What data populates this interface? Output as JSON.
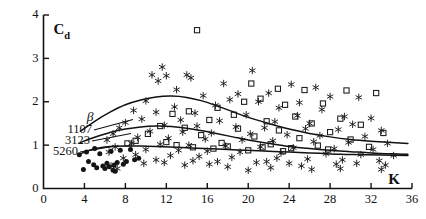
{
  "chart_data": {
    "type": "scatter",
    "title": "",
    "xlabel": "K",
    "ylabel": "Cd",
    "ylabel_main": "C",
    "ylabel_sub": "d",
    "xlim": [
      0,
      36
    ],
    "ylim": [
      0,
      4
    ],
    "xticks": [
      0,
      4,
      8,
      12,
      16,
      20,
      24,
      28,
      32,
      36
    ],
    "yticks": [
      0,
      1,
      2,
      3,
      4
    ],
    "grid": false,
    "legend_position": "inside-left",
    "legend_header": "β",
    "legend_entries": [
      {
        "label": "1107",
        "curve": "beta_1107"
      },
      {
        "label": "3123",
        "curve": "beta_3123"
      },
      {
        "label": "5260",
        "curve": "beta_5260"
      }
    ],
    "series": [
      {
        "name": "beta_1107",
        "kind": "curve",
        "points": [
          [
            3.6,
            1.32
          ],
          [
            5.0,
            1.55
          ],
          [
            6.5,
            1.76
          ],
          [
            8.0,
            1.93
          ],
          [
            9.5,
            2.04
          ],
          [
            11.0,
            2.11
          ],
          [
            12.5,
            2.13
          ],
          [
            14.0,
            2.1
          ],
          [
            15.5,
            2.02
          ],
          [
            17.0,
            1.9
          ],
          [
            18.5,
            1.77
          ],
          [
            20.0,
            1.64
          ],
          [
            22.0,
            1.5
          ],
          [
            24.0,
            1.37
          ],
          [
            26.0,
            1.27
          ],
          [
            28.0,
            1.19
          ],
          [
            30.0,
            1.13
          ],
          [
            32.0,
            1.09
          ],
          [
            34.0,
            1.06
          ],
          [
            35.6,
            1.04
          ]
        ]
      },
      {
        "name": "beta_3123",
        "kind": "curve",
        "points": [
          [
            3.6,
            1.06
          ],
          [
            5.0,
            1.18
          ],
          [
            6.5,
            1.29
          ],
          [
            8.0,
            1.37
          ],
          [
            9.5,
            1.42
          ],
          [
            11.0,
            1.44
          ],
          [
            12.5,
            1.43
          ],
          [
            14.0,
            1.39
          ],
          [
            15.5,
            1.33
          ],
          [
            17.0,
            1.26
          ],
          [
            18.5,
            1.19
          ],
          [
            20.0,
            1.12
          ],
          [
            22.0,
            1.04
          ],
          [
            24.0,
            0.97
          ],
          [
            26.0,
            0.92
          ],
          [
            28.0,
            0.88
          ],
          [
            30.0,
            0.85
          ],
          [
            32.0,
            0.82
          ],
          [
            34.0,
            0.8
          ],
          [
            35.6,
            0.79
          ]
        ]
      },
      {
        "name": "beta_5260",
        "kind": "curve",
        "points": [
          [
            3.6,
            0.8
          ],
          [
            4.5,
            0.88
          ],
          [
            5.5,
            0.94
          ],
          [
            6.5,
            0.97
          ],
          [
            8.0,
            0.98
          ],
          [
            9.5,
            0.98
          ],
          [
            11.0,
            0.97
          ],
          [
            13.0,
            0.95
          ],
          [
            15.0,
            0.93
          ],
          [
            17.0,
            0.91
          ],
          [
            19.0,
            0.89
          ],
          [
            21.0,
            0.87
          ],
          [
            23.0,
            0.85
          ],
          [
            25.0,
            0.83
          ],
          [
            27.0,
            0.81
          ],
          [
            29.0,
            0.79
          ],
          [
            31.0,
            0.78
          ],
          [
            33.0,
            0.77
          ],
          [
            35.6,
            0.76
          ]
        ]
      },
      {
        "name": "squares",
        "kind": "scatter",
        "marker": "open-square",
        "points": [
          [
            15.0,
            3.65
          ],
          [
            20.3,
            2.42
          ],
          [
            22.9,
            2.3
          ],
          [
            25.5,
            2.27
          ],
          [
            29.6,
            2.26
          ],
          [
            32.5,
            2.2
          ],
          [
            21.2,
            2.07
          ],
          [
            19.6,
            2.0
          ],
          [
            27.3,
            1.96
          ],
          [
            23.6,
            1.93
          ],
          [
            17.0,
            1.86
          ],
          [
            14.2,
            1.78
          ],
          [
            12.6,
            1.72
          ],
          [
            18.6,
            1.7
          ],
          [
            24.6,
            1.66
          ],
          [
            29.0,
            1.61
          ],
          [
            16.2,
            1.58
          ],
          [
            21.8,
            1.55
          ],
          [
            26.2,
            1.5
          ],
          [
            31.0,
            1.47
          ],
          [
            11.4,
            1.44
          ],
          [
            13.8,
            1.4
          ],
          [
            19.0,
            1.38
          ],
          [
            23.0,
            1.34
          ],
          [
            28.0,
            1.3
          ],
          [
            33.2,
            1.28
          ],
          [
            10.2,
            1.26
          ],
          [
            15.4,
            1.23
          ],
          [
            20.6,
            1.2
          ],
          [
            25.0,
            1.16
          ],
          [
            30.0,
            1.13
          ],
          [
            9.0,
            1.1
          ],
          [
            12.0,
            1.07
          ],
          [
            17.4,
            1.05
          ],
          [
            22.2,
            1.02
          ],
          [
            26.8,
            0.99
          ],
          [
            31.8,
            0.96
          ],
          [
            8.2,
            1.04
          ],
          [
            13.0,
            1.0
          ],
          [
            18.0,
            0.97
          ],
          [
            21.4,
            0.95
          ],
          [
            24.2,
            0.93
          ],
          [
            27.8,
            0.9
          ],
          [
            20.0,
            0.88
          ],
          [
            23.4,
            0.86
          ],
          [
            16.6,
            0.92
          ],
          [
            14.6,
            0.95
          ]
        ]
      },
      {
        "name": "asterisks",
        "kind": "scatter",
        "marker": "asterisk",
        "points": [
          [
            11.6,
            2.8
          ],
          [
            10.6,
            2.62
          ],
          [
            12.0,
            2.6
          ],
          [
            14.0,
            2.62
          ],
          [
            14.4,
            2.55
          ],
          [
            11.2,
            2.48
          ],
          [
            20.4,
            2.72
          ],
          [
            17.6,
            2.42
          ],
          [
            24.2,
            2.4
          ],
          [
            26.6,
            2.33
          ],
          [
            22.0,
            2.2
          ],
          [
            19.0,
            2.18
          ],
          [
            13.0,
            2.28
          ],
          [
            15.6,
            2.14
          ],
          [
            28.0,
            2.12
          ],
          [
            30.8,
            2.1
          ],
          [
            18.2,
            2.05
          ],
          [
            21.0,
            2.0
          ],
          [
            25.0,
            1.98
          ],
          [
            16.8,
            1.92
          ],
          [
            10.0,
            2.02
          ],
          [
            12.8,
            1.88
          ],
          [
            23.0,
            1.86
          ],
          [
            27.2,
            1.82
          ],
          [
            8.8,
            1.8
          ],
          [
            11.0,
            1.76
          ],
          [
            14.8,
            1.74
          ],
          [
            19.8,
            1.7
          ],
          [
            24.8,
            1.68
          ],
          [
            29.4,
            1.66
          ],
          [
            32.0,
            1.62
          ],
          [
            9.6,
            1.6
          ],
          [
            13.4,
            1.58
          ],
          [
            17.2,
            1.56
          ],
          [
            22.6,
            1.54
          ],
          [
            26.0,
            1.5
          ],
          [
            30.2,
            1.48
          ],
          [
            8.0,
            1.52
          ],
          [
            11.8,
            1.46
          ],
          [
            15.0,
            1.44
          ],
          [
            18.8,
            1.42
          ],
          [
            21.6,
            1.4
          ],
          [
            25.6,
            1.38
          ],
          [
            28.8,
            1.36
          ],
          [
            33.0,
            1.34
          ],
          [
            7.4,
            1.4
          ],
          [
            10.4,
            1.32
          ],
          [
            13.6,
            1.3
          ],
          [
            16.4,
            1.28
          ],
          [
            20.2,
            1.26
          ],
          [
            23.8,
            1.24
          ],
          [
            27.0,
            1.22
          ],
          [
            31.4,
            1.2
          ],
          [
            6.8,
            1.26
          ],
          [
            9.2,
            1.18
          ],
          [
            12.2,
            1.16
          ],
          [
            15.8,
            1.14
          ],
          [
            19.4,
            1.12
          ],
          [
            22.4,
            1.1
          ],
          [
            26.4,
            1.08
          ],
          [
            29.8,
            1.06
          ],
          [
            33.6,
            1.04
          ],
          [
            6.2,
            1.12
          ],
          [
            8.6,
            1.04
          ],
          [
            11.4,
            1.02
          ],
          [
            14.2,
            1.0
          ],
          [
            17.8,
            0.98
          ],
          [
            21.2,
            0.96
          ],
          [
            24.4,
            0.94
          ],
          [
            28.4,
            0.92
          ],
          [
            32.2,
            0.9
          ],
          [
            7.0,
            0.96
          ],
          [
            10.0,
            0.9
          ],
          [
            13.2,
            0.88
          ],
          [
            16.0,
            0.86
          ],
          [
            19.2,
            0.84
          ],
          [
            23.2,
            0.82
          ],
          [
            27.6,
            0.8
          ],
          [
            31.0,
            0.78
          ],
          [
            34.2,
            0.76
          ],
          [
            6.4,
            0.84
          ],
          [
            9.0,
            0.78
          ],
          [
            12.4,
            0.76
          ],
          [
            15.2,
            0.74
          ],
          [
            18.4,
            0.72
          ],
          [
            22.8,
            0.7
          ],
          [
            25.8,
            0.68
          ],
          [
            29.2,
            0.66
          ],
          [
            32.8,
            0.64
          ],
          [
            7.8,
            0.7
          ],
          [
            11.0,
            0.66
          ],
          [
            14.6,
            0.64
          ],
          [
            17.0,
            0.62
          ],
          [
            20.8,
            0.6
          ],
          [
            24.0,
            0.58
          ],
          [
            28.6,
            0.56
          ],
          [
            33.4,
            0.54
          ],
          [
            9.8,
            0.58
          ],
          [
            13.8,
            0.54
          ],
          [
            18.0,
            0.5
          ],
          [
            20.0,
            0.42
          ],
          [
            22.2,
            0.48
          ],
          [
            26.2,
            0.44
          ],
          [
            29.0,
            0.46
          ],
          [
            6.6,
            0.52
          ],
          [
            7.2,
            0.46
          ],
          [
            25.2,
            0.52
          ],
          [
            30.6,
            0.58
          ],
          [
            33.0,
            0.44
          ],
          [
            16.2,
            0.56
          ],
          [
            11.8,
            0.6
          ],
          [
            21.8,
            0.62
          ]
        ]
      },
      {
        "name": "circles",
        "kind": "scatter",
        "marker": "filled-circle",
        "points": [
          [
            3.5,
            0.78
          ],
          [
            3.9,
            0.44
          ],
          [
            4.4,
            0.62
          ],
          [
            4.9,
            0.55
          ],
          [
            5.2,
            0.48
          ],
          [
            5.5,
            0.8
          ],
          [
            5.8,
            0.52
          ],
          [
            6.0,
            0.46
          ],
          [
            6.2,
            0.58
          ],
          [
            6.4,
            0.5
          ],
          [
            6.6,
            0.86
          ],
          [
            6.9,
            0.54
          ],
          [
            7.2,
            0.6
          ],
          [
            7.5,
            0.88
          ],
          [
            7.8,
            0.56
          ],
          [
            8.1,
            0.62
          ],
          [
            8.5,
            0.9
          ],
          [
            8.9,
            0.66
          ],
          [
            9.3,
            0.7
          ],
          [
            5.0,
            0.92
          ],
          [
            4.2,
            0.84
          ],
          [
            6.8,
            0.42
          ],
          [
            7.0,
            0.4
          ]
        ]
      }
    ]
  },
  "axes": {
    "x_label": "K",
    "y_label_main": "C",
    "y_label_sub": "d",
    "x_tick_labels": [
      "0",
      "4",
      "8",
      "12",
      "16",
      "20",
      "24",
      "28",
      "32",
      "36"
    ],
    "y_tick_labels": [
      "0",
      "1",
      "2",
      "3",
      "4"
    ]
  },
  "legend": {
    "header": "β",
    "items": [
      "1107",
      "3123",
      "5260"
    ]
  },
  "colors": {
    "ink": "#111111",
    "background": "#ffffff"
  }
}
